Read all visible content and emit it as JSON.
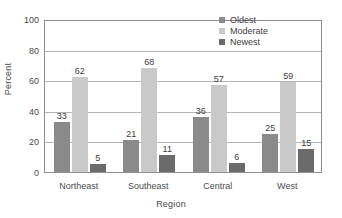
{
  "chart_data": {
    "type": "bar",
    "title": "",
    "xlabel": "Region",
    "ylabel": "Percent",
    "categories": [
      "Northeast",
      "Southeast",
      "Central",
      "West"
    ],
    "series": [
      {
        "name": "Oldest",
        "values": [
          33,
          21,
          36,
          25
        ],
        "color": "#8a8a8a"
      },
      {
        "name": "Moderate",
        "values": [
          62,
          68,
          57,
          59
        ],
        "color": "#c9c9c9"
      },
      {
        "name": "Newest",
        "values": [
          5,
          11,
          6,
          15
        ],
        "color": "#6b6b6b"
      }
    ],
    "ylim": [
      0,
      100
    ],
    "yticks": [
      0,
      20,
      40,
      60,
      80,
      100
    ],
    "ytick_labels": [
      "0",
      "20",
      "40",
      "60",
      "80",
      "100"
    ],
    "grid": true,
    "grid_axis": "y",
    "legend_position": "top-right",
    "data_labels": true
  },
  "axes": {
    "y_title": "Percent",
    "x_title": "Region"
  },
  "legend": {
    "entries": [
      {
        "label": "Oldest",
        "swatch": "#8a8a8a"
      },
      {
        "label": "Moderate",
        "swatch": "#c9c9c9"
      },
      {
        "label": "Newest",
        "swatch": "#6b6b6b"
      }
    ]
  },
  "colors": {
    "background": "#ffffff",
    "frame": "#8e8e8e",
    "grid": "#b4b4b4",
    "text": "#4a4a4a"
  }
}
